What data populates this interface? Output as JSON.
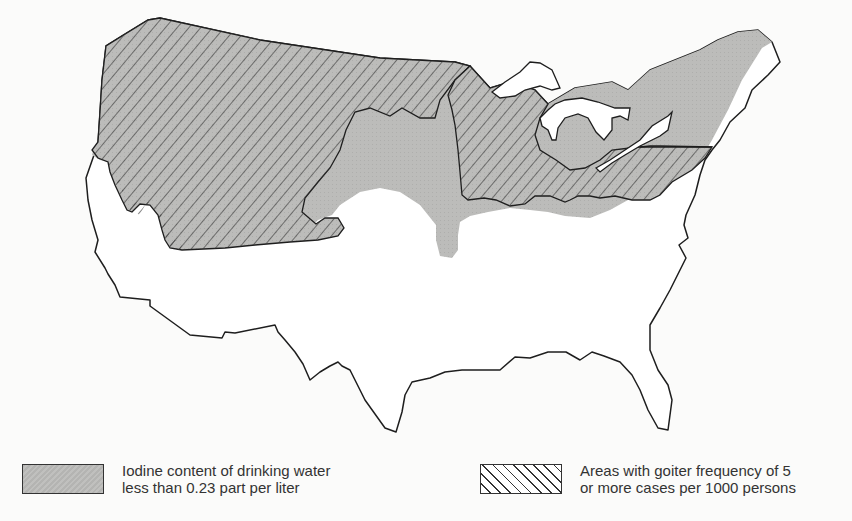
{
  "map": {
    "title": "",
    "region": "Contiguous United States",
    "layers": [
      {
        "id": "iodine",
        "fill": "#b8b8b6",
        "pattern": "solid-gray"
      },
      {
        "id": "goiter",
        "fill": "none",
        "pattern": "diagonal-hatch",
        "stroke": "#333333"
      }
    ]
  },
  "legend": {
    "items": [
      {
        "swatch": "solid-gray",
        "line1": "Iodine content of drinking water",
        "line2": "less than 0.23 part per liter"
      },
      {
        "swatch": "diagonal-hatch",
        "line1": "Areas with goiter frequency of 5",
        "line2": "or more cases per 1000 persons"
      }
    ]
  },
  "colors": {
    "background": "#fbfbfa",
    "outline": "#1e1e1e",
    "iodine_gray": "#b8b8b6",
    "hatch": "#333333"
  }
}
